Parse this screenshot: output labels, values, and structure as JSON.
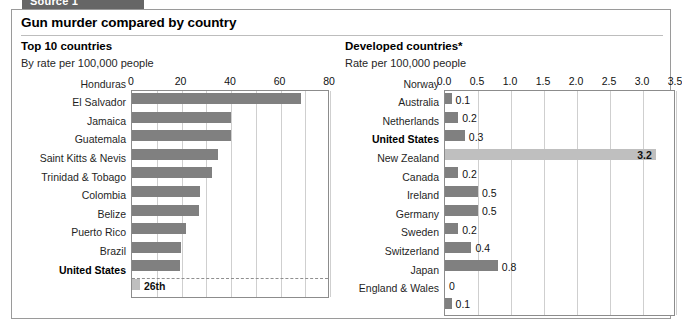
{
  "source_tab": {
    "label": "Source 1"
  },
  "panel": {
    "headline": "Gun murder compared by country"
  },
  "left": {
    "subtitle": "Top 10 countries",
    "unit": "By rate per 100,000 people"
  },
  "right": {
    "subtitle": "Developed countries*",
    "unit": "Rate per 100,000 people"
  },
  "colors": {
    "bar": "#808080",
    "bar_highlight": "#bfbfbf",
    "grid": "#cfcfcf",
    "frame": "#8c8c8c",
    "tab": "#666666"
  },
  "chart_data": [
    {
      "type": "bar",
      "orientation": "horizontal",
      "title": "Top 10 countries",
      "subtitle": "By rate per 100,000 people",
      "xlabel": "",
      "ylabel": "",
      "xlim": [
        0,
        80
      ],
      "xticks": [
        0,
        20,
        40,
        60,
        80
      ],
      "xticklabels": [
        "0",
        "20",
        "40",
        "60",
        "80"
      ],
      "grid": true,
      "grid_step": 10,
      "legend": "none",
      "categories": [
        "Honduras",
        "El Salvador",
        "Jamaica",
        "Guatemala",
        "Saint Kitts & Nevis",
        "Trinidad & Tobago",
        "Colombia",
        "Belize",
        "Puerto Rico",
        "Brazil",
        "United States"
      ],
      "values": [
        68.4,
        39.9,
        39.8,
        34.8,
        32.4,
        27.3,
        27.1,
        21.8,
        19.6,
        19.5,
        3.2
      ],
      "data_labels": [
        "",
        "",
        "",
        "",
        "",
        "",
        "",
        "",
        "",
        "",
        "26th"
      ],
      "highlight_index": 10,
      "separator_before_index": 10,
      "note": "United States row is separated by a dashed line and shown with a light bar labelled 26th"
    },
    {
      "type": "bar",
      "orientation": "horizontal",
      "title": "Developed countries*",
      "subtitle": "Rate per 100,000 people",
      "xlabel": "",
      "ylabel": "",
      "xlim": [
        0,
        3.5
      ],
      "xticks": [
        0.0,
        0.5,
        1.0,
        1.5,
        2.0,
        2.5,
        3.0,
        3.5
      ],
      "xticklabels": [
        "0.0",
        "0.5",
        "1.0",
        "1.5",
        "2.0",
        "2.5",
        "3.0",
        "3.5"
      ],
      "grid": true,
      "grid_step": 0.5,
      "legend": "none",
      "categories": [
        "Norway",
        "Australia",
        "Netherlands",
        "United States",
        "New Zealand",
        "Canada",
        "Ireland",
        "Germany",
        "Sweden",
        "Switzerland",
        "Japan",
        "England & Wales"
      ],
      "values": [
        0.1,
        0.2,
        0.3,
        3.2,
        0.2,
        0.5,
        0.5,
        0.2,
        0.4,
        0.8,
        0.0,
        0.1
      ],
      "data_labels": [
        "0.1",
        "0.2",
        "0.3",
        "3.2",
        "0.2",
        "0.5",
        "0.5",
        "0.2",
        "0.4",
        "0.8",
        "0",
        "0.1"
      ],
      "highlight_index": 3
    }
  ]
}
